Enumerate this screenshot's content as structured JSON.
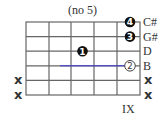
{
  "title": "(no 5)",
  "position_label": "IX",
  "string_labels": [
    "C#",
    "G#",
    "D",
    "B",
    "x",
    "x"
  ],
  "left_mutes": [
    "",
    "",
    "",
    "",
    "x",
    "x"
  ],
  "fingers": [
    {
      "string": 1,
      "fret": 5,
      "label": "4",
      "style": "filled"
    },
    {
      "string": 2,
      "fret": 5,
      "label": "3",
      "style": "filled"
    },
    {
      "string": 3,
      "fret": 3,
      "label": "1",
      "style": "filled"
    },
    {
      "string": 4,
      "fret": 5,
      "label": "2",
      "style": "open"
    }
  ],
  "colors": {
    "grid": "#555555",
    "dot": "#111111",
    "text": "#333333"
  }
}
